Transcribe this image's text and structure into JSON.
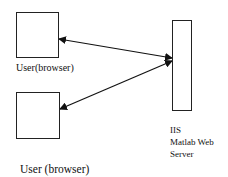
{
  "diagram": {
    "nodes": [
      {
        "id": "user1",
        "label": "User(browser)"
      },
      {
        "id": "user2",
        "label": "User (browser)"
      },
      {
        "id": "server",
        "label_lines": [
          "IIS",
          "Matlab Web",
          "Server"
        ]
      }
    ],
    "edges": [
      {
        "from": "user1",
        "to": "server",
        "direction": "both"
      },
      {
        "from": "user2",
        "to": "server",
        "direction": "both"
      }
    ]
  }
}
